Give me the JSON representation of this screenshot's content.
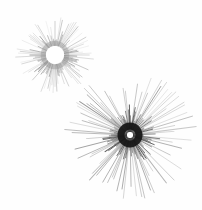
{
  "figure": {
    "title": "",
    "background_color": "#fefefe",
    "width": 202,
    "height": 210
  },
  "chart_data": {
    "type": "scatter",
    "title": "",
    "xlabel": "",
    "ylabel": "",
    "bursts": [
      {
        "name": "small-burst",
        "cx": 55,
        "cy": 55,
        "core_radius": 9,
        "core_color": "#ffffff",
        "ray_count": 120,
        "inner_radius": 9,
        "max_radius": 39,
        "min_radius": 19,
        "ray_color": "#7a7a7a",
        "ray_width": 0.55,
        "ring_color": "#9a9a9a",
        "ring_radius": 12
      },
      {
        "name": "large-burst",
        "cx": 130,
        "cy": 135,
        "core_radius": 3,
        "core_color": "#ffffff",
        "ray_count": 150,
        "inner_radius": 3,
        "max_radius": 66,
        "min_radius": 22,
        "ray_color": "#3d3d3d",
        "ray_width": 0.7,
        "ring_color": "#151515",
        "ring_radius": 9
      }
    ]
  }
}
